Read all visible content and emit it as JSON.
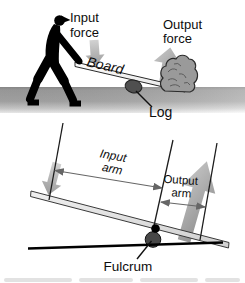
{
  "colors": {
    "silhouette": "#000000",
    "arrow_light": "#cbcbcb",
    "arrow_dark": "#8a8a8a",
    "small_arrow_light": "#d2d2d2",
    "small_arrow_dark": "#9b9b9b",
    "ground_gray": "#a5a5a5",
    "log_fill": "#4f4f4f",
    "rock_fill": "#9a9a9a",
    "fulcrum_fill": "#474747",
    "line_black": "#1c1c1c",
    "dim_arrow_gray": "#666666"
  },
  "top_diagram": {
    "input_force_label": {
      "line1": "Input",
      "line2": "force"
    },
    "output_force_label": {
      "line1": "Output",
      "line2": "force"
    },
    "board_label": "Board",
    "log_label": "Log"
  },
  "bottom_diagram": {
    "input_arm_label": {
      "line1": "Input",
      "line2": "arm"
    },
    "output_arm_label": {
      "line1": "Output",
      "line2": "arm"
    },
    "fulcrum_label": "Fulcrum"
  }
}
